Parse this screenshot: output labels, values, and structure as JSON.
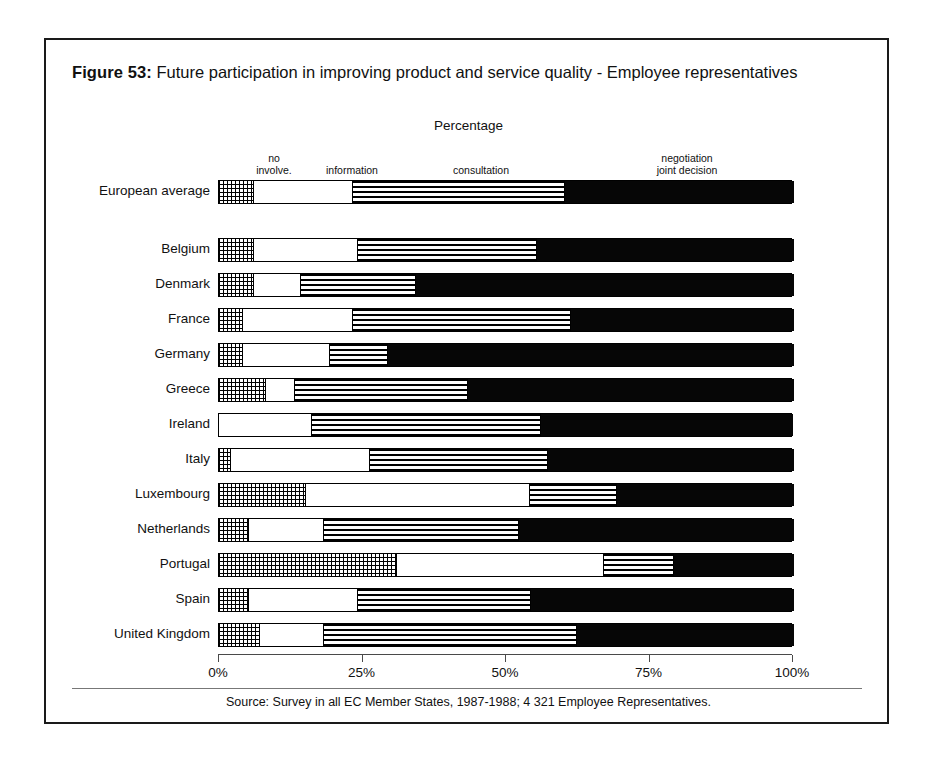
{
  "figure": {
    "number": "Figure 53:",
    "title": "Future participation in improving product and service quality - Employee representatives",
    "axis_caption": "Percentage",
    "source": "Source: Survey in all EC Member States, 1987-1988; 4 321 Employee Representatives."
  },
  "legend": {
    "no_involvement": "no\ninvolve.",
    "information": "information",
    "consultation": "consultation",
    "negotiation": "negotiation\njoint decision"
  },
  "axis": {
    "ticks": [
      "0%",
      "25%",
      "50%",
      "75%",
      "100%"
    ],
    "values": [
      0,
      25,
      50,
      75,
      100
    ],
    "min": 0,
    "max": 100
  },
  "colors": {
    "no_involvement": "#ffffff-dotted",
    "information": "#ffffff",
    "consultation": "#ffffff-striped",
    "negotiation": "#060606",
    "frame": "#1a1a1a",
    "axis": "#4a4a4a"
  },
  "chart_data": {
    "type": "bar",
    "orientation": "horizontal",
    "stacked": true,
    "normalized": true,
    "title": "Future participation in improving product and service quality - Employee representatives",
    "xlabel": "Percentage",
    "ylabel": "",
    "xlim": [
      0,
      100
    ],
    "grid": false,
    "legend_position": "top",
    "categories": [
      "European average",
      "Belgium",
      "Denmark",
      "France",
      "Germany",
      "Greece",
      "Ireland",
      "Italy",
      "Luxembourg",
      "Netherlands",
      "Portugal",
      "Spain",
      "United Kingdom"
    ],
    "series": [
      {
        "name": "no involve.",
        "values": [
          6,
          6,
          6,
          4,
          4,
          8,
          0,
          2,
          15,
          5,
          31,
          5,
          7
        ]
      },
      {
        "name": "information",
        "values": [
          17,
          18,
          8,
          19,
          15,
          5,
          16,
          24,
          39,
          13,
          36,
          19,
          11
        ]
      },
      {
        "name": "consultation",
        "values": [
          37,
          31,
          20,
          38,
          10,
          30,
          40,
          31,
          15,
          34,
          12,
          30,
          44
        ]
      },
      {
        "name": "negotiation joint decision",
        "values": [
          40,
          45,
          66,
          39,
          71,
          57,
          44,
          43,
          31,
          48,
          21,
          46,
          38
        ]
      }
    ]
  }
}
